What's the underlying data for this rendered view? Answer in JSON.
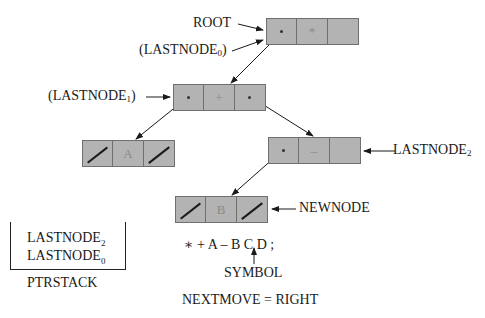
{
  "diagram": {
    "nodes": {
      "root": {
        "value": "*",
        "left": "pointer",
        "right": "empty"
      },
      "plus": {
        "value": "+",
        "left": "pointer",
        "right": "pointer"
      },
      "a": {
        "value": "A",
        "left": "nil",
        "right": "nil"
      },
      "minus": {
        "value": "–",
        "left": "pointer",
        "right": "empty"
      },
      "b": {
        "value": "B",
        "left": "nil",
        "right": "nil"
      }
    },
    "labels": {
      "root": "ROOT",
      "lastnode0_paren": "(LASTNODE",
      "lastnode0_sub": "0",
      "lastnode0_close": ")",
      "lastnode1_paren": "(LASTNODE",
      "lastnode1_sub": "1",
      "lastnode1_close": ")",
      "lastnode2": "LASTNODE",
      "lastnode2_sub": "2",
      "newnode": "NEWNODE"
    },
    "stack": {
      "title": "PTRSTACK",
      "entries": [
        {
          "name": "LASTNODE",
          "sub": "2"
        },
        {
          "name": "LASTNODE",
          "sub": "0"
        }
      ]
    },
    "input": {
      "expression": "∗ + A – B C D ;",
      "symbol_label": "SYMBOL",
      "current_symbol": "C"
    },
    "nextmove": "NEXTMOVE = RIGHT"
  }
}
